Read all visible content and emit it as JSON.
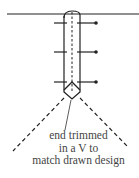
{
  "diagram": {
    "annotation": {
      "lines": [
        "end trimmed",
        "in a V to",
        "match drawn design"
      ]
    },
    "colors": {
      "stroke": "#222222",
      "text": "#444444",
      "background": "#ffffff"
    }
  }
}
